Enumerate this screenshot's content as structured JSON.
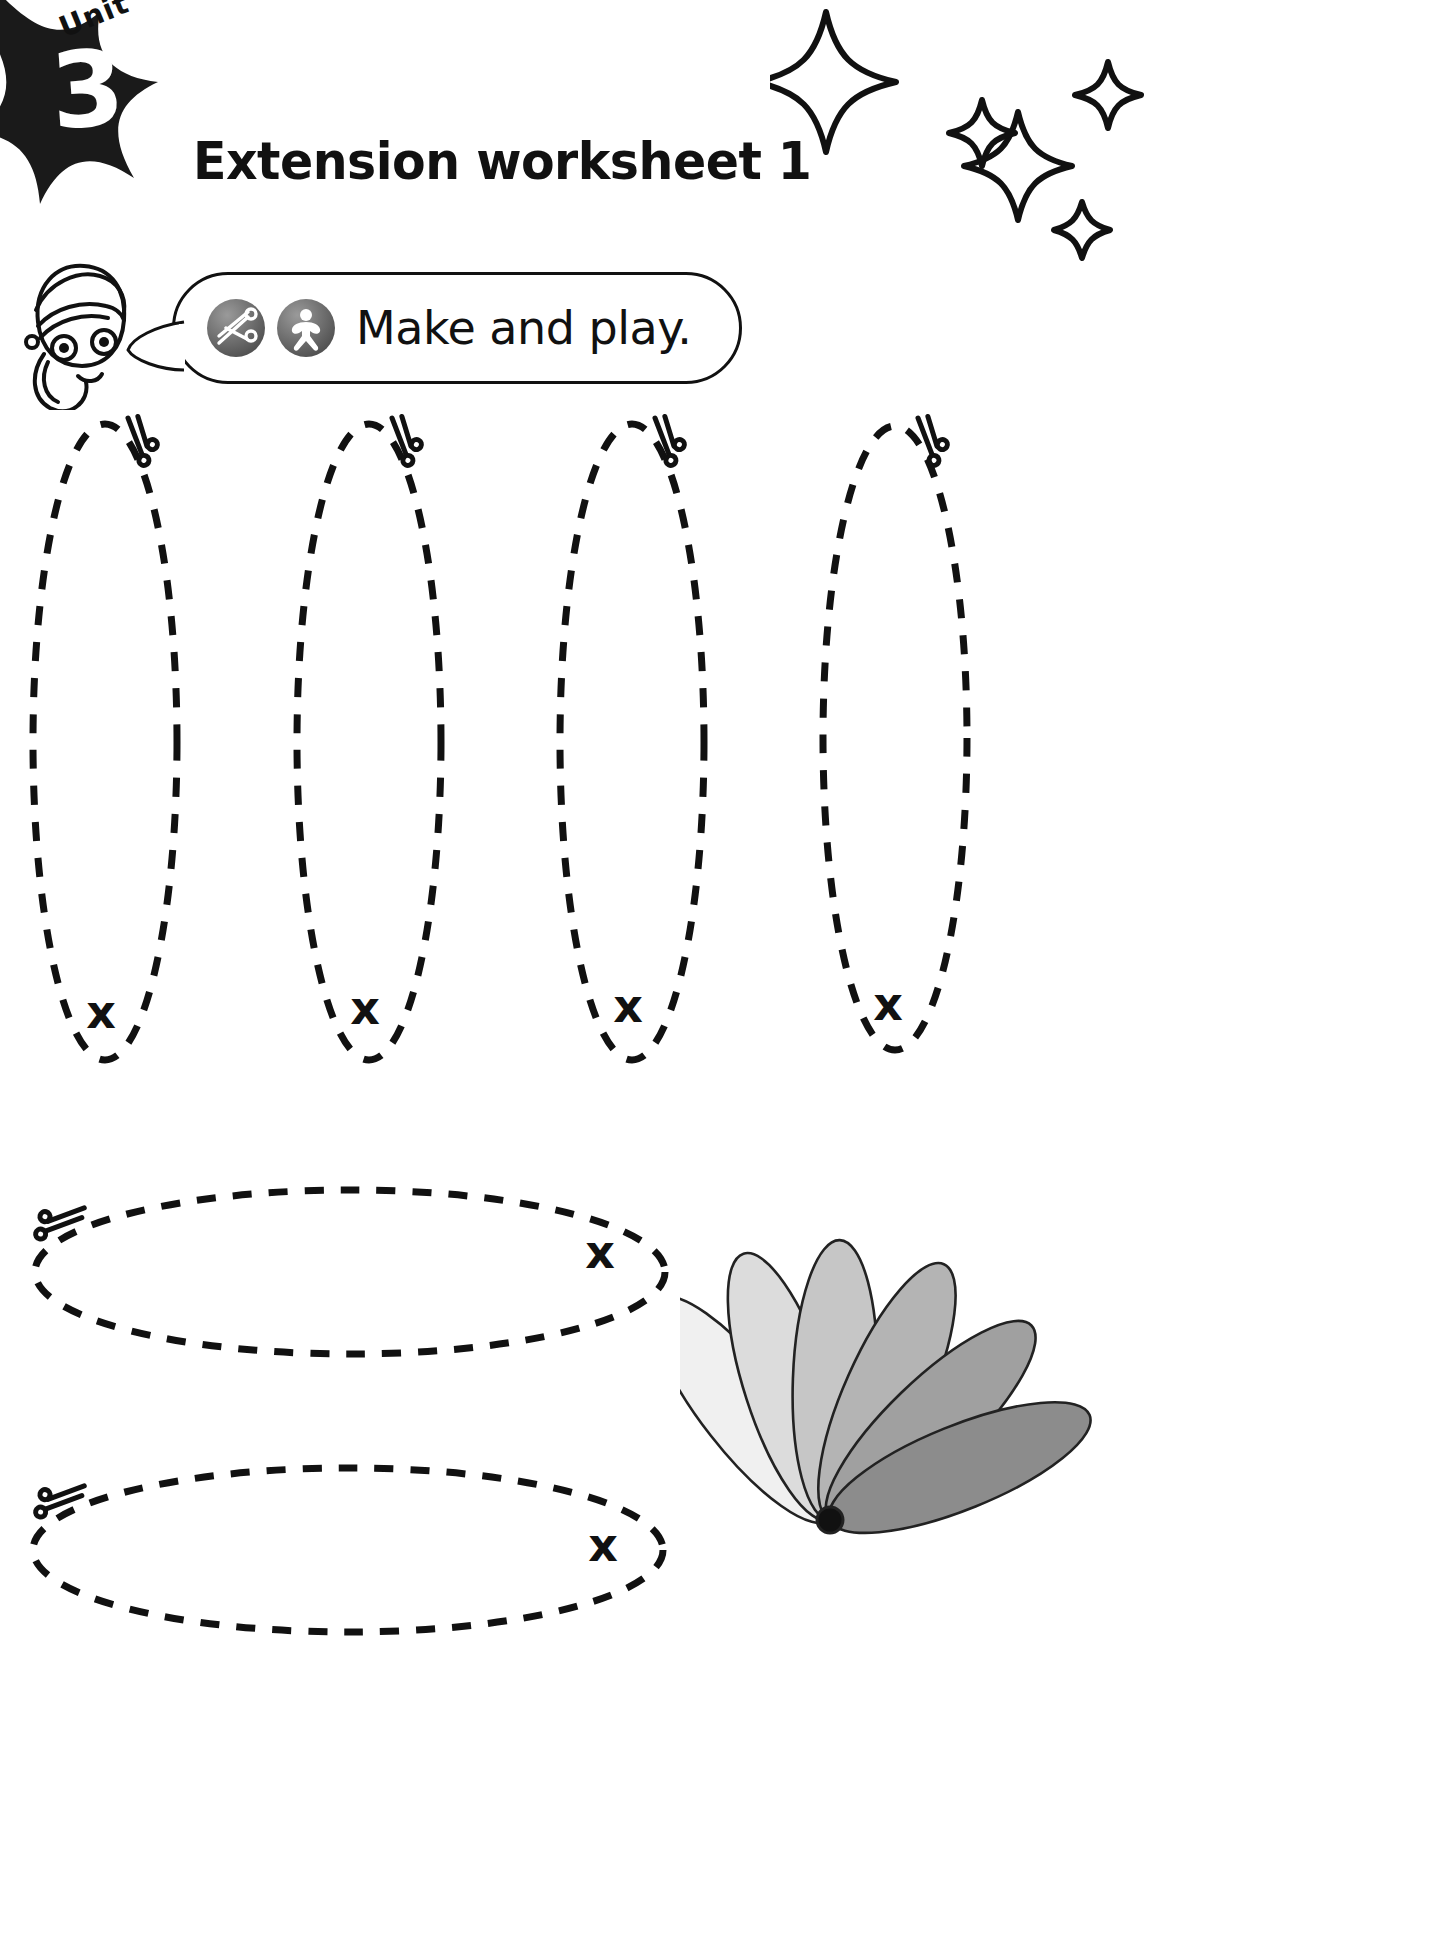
{
  "header": {
    "unit_word": "Unit",
    "unit_number": "3",
    "title": "Extension worksheet 1",
    "badge_color": "#1a1a1a",
    "sparkle_count": 5
  },
  "instruction": {
    "text": "Make and play.",
    "icons": [
      {
        "name": "scissors-icon",
        "label": "cut"
      },
      {
        "name": "make-and-play-figure-icon",
        "label": "play"
      }
    ],
    "character": "girl-character"
  },
  "worksheet": {
    "cut_marker_label": "x",
    "vertical_pieces": [
      {
        "cx": 105,
        "cy": 742,
        "rx": 72,
        "ry": 318,
        "x_mark": {
          "x": 101,
          "y": 1012
        },
        "scissors": {
          "x": 128,
          "y": 418
        }
      },
      {
        "cx": 369,
        "cy": 742,
        "rx": 72,
        "ry": 318,
        "x_mark": {
          "x": 365,
          "y": 1008
        },
        "scissors": {
          "x": 392,
          "y": 418
        }
      },
      {
        "cx": 632,
        "cy": 742,
        "rx": 72,
        "ry": 318,
        "x_mark": {
          "x": 628,
          "y": 1006
        },
        "scissors": {
          "x": 655,
          "y": 418
        }
      },
      {
        "cx": 895,
        "cy": 738,
        "rx": 72,
        "ry": 312,
        "x_mark": {
          "x": 888,
          "y": 1004
        },
        "scissors": {
          "x": 918,
          "y": 418
        }
      }
    ],
    "horizontal_pieces": [
      {
        "cx": 350,
        "cy": 1272,
        "rx": 315,
        "ry": 82,
        "x_mark": {
          "x": 600,
          "y": 1252
        },
        "scissors": {
          "x": 52,
          "y": 1213
        }
      },
      {
        "cx": 348,
        "cy": 1550,
        "rx": 315,
        "ry": 82,
        "x_mark": {
          "x": 603,
          "y": 1545
        },
        "scissors": {
          "x": 52,
          "y": 1490
        }
      }
    ],
    "fan_illustration": {
      "name": "paper-fan",
      "petals": 6,
      "petal_shades": [
        "#f0f0f0",
        "#dcdcdc",
        "#c6c6c6",
        "#b4b4b4",
        "#a0a0a0",
        "#8c8c8c"
      ],
      "outline_color": "#222222",
      "pivot_color": "#111111"
    }
  }
}
